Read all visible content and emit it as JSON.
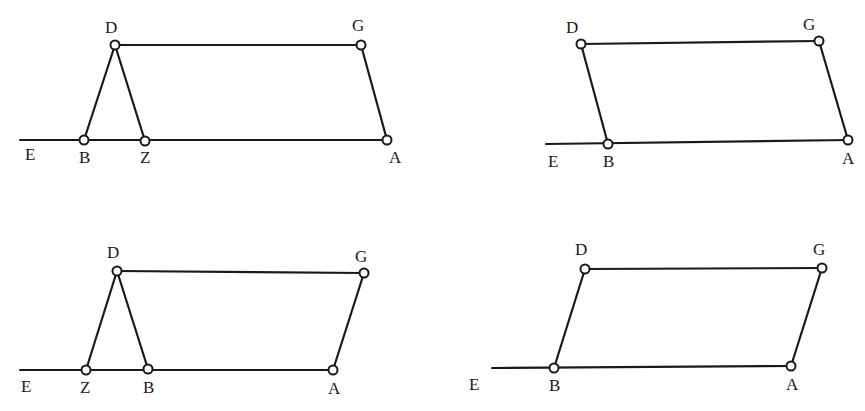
{
  "figures": [
    {
      "id": "fig1",
      "description": "Triangle DBZ with parallelogram-like figure DGA, Z to right of B",
      "baseline": {
        "x1": 20,
        "y1": 140,
        "x2": 387,
        "y2": 140
      },
      "points": [
        {
          "name": "D",
          "x": 115,
          "y": 45,
          "lx": 105,
          "ly": 33
        },
        {
          "name": "G",
          "x": 361,
          "y": 45,
          "lx": 352,
          "ly": 31
        },
        {
          "name": "B",
          "x": 84,
          "y": 140,
          "lx": 79,
          "ly": 163
        },
        {
          "name": "Z",
          "x": 145,
          "y": 141,
          "lx": 140,
          "ly": 163
        },
        {
          "name": "A",
          "x": 387,
          "y": 140,
          "lx": 389,
          "ly": 163
        },
        {
          "name": "E",
          "x": null,
          "y": null,
          "lx": 25,
          "ly": 160
        }
      ],
      "segments": [
        [
          "D",
          "G"
        ],
        [
          "G",
          "A"
        ],
        [
          "D",
          "B"
        ],
        [
          "D",
          "Z"
        ]
      ]
    },
    {
      "id": "fig2",
      "description": "Parallelogram DGAB",
      "baseline": {
        "x1": 546,
        "y1": 144,
        "x2": 848,
        "y2": 140
      },
      "points": [
        {
          "name": "D",
          "x": 581,
          "y": 44,
          "lx": 566,
          "ly": 33
        },
        {
          "name": "G",
          "x": 819,
          "y": 41,
          "lx": 803,
          "ly": 30
        },
        {
          "name": "B",
          "x": 608,
          "y": 144,
          "lx": 603,
          "ly": 167
        },
        {
          "name": "A",
          "x": 848,
          "y": 140,
          "lx": 842,
          "ly": 164
        },
        {
          "name": "E",
          "x": null,
          "y": null,
          "lx": 548,
          "ly": 167
        }
      ],
      "segments": [
        [
          "D",
          "G"
        ],
        [
          "G",
          "A"
        ],
        [
          "D",
          "B"
        ]
      ]
    },
    {
      "id": "fig3",
      "description": "Triangle DZB with figure DGA, Z to left of B",
      "baseline": {
        "x1": 20,
        "y1": 370,
        "x2": 333,
        "y2": 370
      },
      "points": [
        {
          "name": "D",
          "x": 117,
          "y": 271,
          "lx": 107,
          "ly": 258
        },
        {
          "name": "G",
          "x": 364,
          "y": 273,
          "lx": 355,
          "ly": 262
        },
        {
          "name": "Z",
          "x": 86,
          "y": 370,
          "lx": 80,
          "ly": 393
        },
        {
          "name": "B",
          "x": 148,
          "y": 369,
          "lx": 143,
          "ly": 393
        },
        {
          "name": "A",
          "x": 333,
          "y": 370,
          "lx": 328,
          "ly": 394
        },
        {
          "name": "E",
          "x": null,
          "y": null,
          "lx": 21,
          "ly": 392
        }
      ],
      "segments": [
        [
          "D",
          "G"
        ],
        [
          "G",
          "A"
        ],
        [
          "D",
          "Z"
        ],
        [
          "D",
          "B"
        ]
      ]
    },
    {
      "id": "fig4",
      "description": "Parallelogram DGAB slanted right",
      "baseline": {
        "x1": 492,
        "y1": 368,
        "x2": 791,
        "y2": 366
      },
      "points": [
        {
          "name": "D",
          "x": 585,
          "y": 269,
          "lx": 575,
          "ly": 255
        },
        {
          "name": "G",
          "x": 822,
          "y": 268,
          "lx": 813,
          "ly": 255
        },
        {
          "name": "B",
          "x": 554,
          "y": 368,
          "lx": 549,
          "ly": 391
        },
        {
          "name": "A",
          "x": 791,
          "y": 366,
          "lx": 786,
          "ly": 390
        },
        {
          "name": "E",
          "x": null,
          "y": null,
          "lx": 469,
          "ly": 390
        }
      ],
      "segments": [
        [
          "D",
          "G"
        ],
        [
          "G",
          "A"
        ],
        [
          "D",
          "B"
        ]
      ]
    }
  ]
}
